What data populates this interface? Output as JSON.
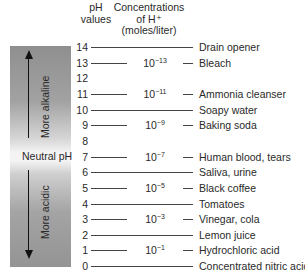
{
  "headers": {
    "ph_values": [
      "pH",
      "values"
    ],
    "concentrations": [
      "Concentrations",
      "of H⁺",
      "(moles/liter)"
    ]
  },
  "scale_bar": {
    "top_label": "More alkaline",
    "middle_label": "Neutral pH",
    "bottom_label": "More acidic",
    "up_arrow_icon": "arrow-up",
    "down_arrow_icon": "arrow-down"
  },
  "rows": [
    {
      "ph": "14",
      "conc_base": "",
      "conc_exp": "",
      "label": "Drain opener"
    },
    {
      "ph": "13",
      "conc_base": "10",
      "conc_exp": "−13",
      "label": "Bleach"
    },
    {
      "ph": "12",
      "conc_base": "",
      "conc_exp": "",
      "label": ""
    },
    {
      "ph": "11",
      "conc_base": "10",
      "conc_exp": "−11",
      "label": "Ammonia cleanser"
    },
    {
      "ph": "10",
      "conc_base": "",
      "conc_exp": "",
      "label": "Soapy water"
    },
    {
      "ph": "9",
      "conc_base": "10",
      "conc_exp": "−9",
      "label": "Baking soda"
    },
    {
      "ph": "8",
      "conc_base": "",
      "conc_exp": "",
      "label": ""
    },
    {
      "ph": "7",
      "conc_base": "10",
      "conc_exp": "−7",
      "label": "Human blood, tears"
    },
    {
      "ph": "6",
      "conc_base": "",
      "conc_exp": "",
      "label": "Saliva, urine"
    },
    {
      "ph": "5",
      "conc_base": "10",
      "conc_exp": "−5",
      "label": "Black coffee"
    },
    {
      "ph": "4",
      "conc_base": "",
      "conc_exp": "",
      "label": "Tomatoes"
    },
    {
      "ph": "3",
      "conc_base": "10",
      "conc_exp": "−3",
      "label": "Vinegar, cola"
    },
    {
      "ph": "2",
      "conc_base": "",
      "conc_exp": "",
      "label": "Lemon juice"
    },
    {
      "ph": "1",
      "conc_base": "10",
      "conc_exp": "−1",
      "label": "Hydrochloric acid"
    },
    {
      "ph": "0",
      "conc_base": "",
      "conc_exp": "",
      "label": "Concentrated nitric acid"
    }
  ],
  "colors": {
    "bar_dark": "#929292",
    "bar_light": "#f3f3f3",
    "line": "#444444",
    "text": "#2a2a2a"
  }
}
